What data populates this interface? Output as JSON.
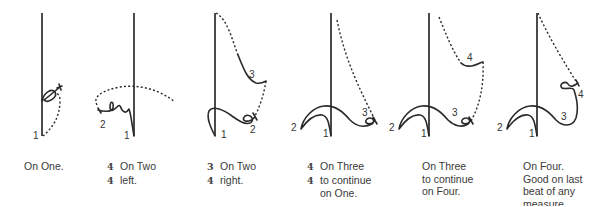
{
  "figures": [
    {
      "id": "on-one",
      "beat_labels": [
        "1"
      ],
      "caption": {
        "lines": [
          {
            "time_sig": "",
            "text": "On One."
          }
        ]
      }
    },
    {
      "id": "on-two-left",
      "beat_labels": [
        "1",
        "2"
      ],
      "caption": {
        "lines": [
          {
            "time_sig": "4",
            "text": "On Two"
          },
          {
            "time_sig": "4",
            "text": "left."
          }
        ]
      }
    },
    {
      "id": "on-two-right",
      "beat_labels": [
        "1",
        "2",
        "3"
      ],
      "caption": {
        "lines": [
          {
            "time_sig": "3",
            "text": "On Two"
          },
          {
            "time_sig": "4",
            "text": "right."
          }
        ]
      }
    },
    {
      "id": "on-three-continue-one",
      "beat_labels": [
        "1",
        "2",
        "3"
      ],
      "caption": {
        "lines": [
          {
            "time_sig": "4",
            "text": "On Three"
          },
          {
            "time_sig": "4",
            "text": "to continue"
          },
          {
            "time_sig": "",
            "text": "on One."
          }
        ]
      }
    },
    {
      "id": "on-three-continue-four",
      "beat_labels": [
        "1",
        "2",
        "3",
        "4"
      ],
      "caption": {
        "lines": [
          {
            "time_sig": "",
            "text": "On Three"
          },
          {
            "time_sig": "",
            "text": "to continue"
          },
          {
            "time_sig": "",
            "text": "on Four."
          }
        ]
      }
    },
    {
      "id": "on-four",
      "beat_labels": [
        "1",
        "2",
        "3",
        "4"
      ],
      "caption": {
        "lines": [
          {
            "time_sig": "",
            "text": "On Four."
          },
          {
            "time_sig": "",
            "text": "Good on last"
          },
          {
            "time_sig": "",
            "text": "beat of any"
          },
          {
            "time_sig": "",
            "text": "measure."
          }
        ]
      }
    }
  ],
  "legend": {
    "solid_line": "beat gesture",
    "dashed_line": "preparatory / pickup motion"
  },
  "colors": {
    "ink": "#2a2a2a",
    "background": "#ffffff"
  }
}
